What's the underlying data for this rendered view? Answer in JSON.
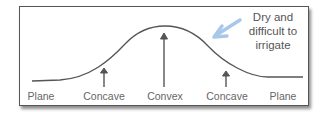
{
  "diagram": {
    "annotation": "Dry and difficult to irrigate",
    "annotation_lines": [
      "Dry and",
      "difficult to",
      "irrigate"
    ],
    "annotation_arrow_color": "#a8c8ea",
    "curve_color": "#555555",
    "labels": [
      {
        "text": "Plane",
        "x": 41
      },
      {
        "text": "Concave",
        "x": 104
      },
      {
        "text": "Convex",
        "x": 165
      },
      {
        "text": "Concave",
        "x": 227
      },
      {
        "text": "Plane",
        "x": 283
      }
    ]
  }
}
